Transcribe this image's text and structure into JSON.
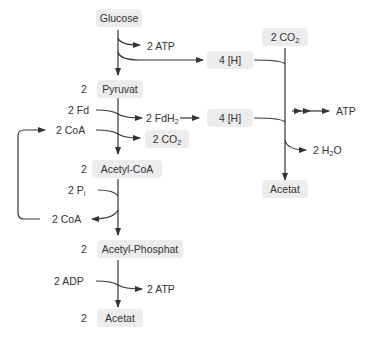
{
  "diagram": {
    "nodes": {
      "glucose": "Glucose",
      "pyruvat": "Pyruvat",
      "pyruvat_coef": "2",
      "acetyl_coa": "Acetyl-CoA",
      "acetyl_coa_coef": "2",
      "acetyl_phosphat": "Acetyl-Phosphat",
      "acetyl_phosphat_coef": "2",
      "acetat_left": "Acetat",
      "acetat_left_coef": "2",
      "h_top": "4  [H]",
      "h_mid": "4  [H]",
      "co2_top_coef": "2",
      "co2_top": "CO",
      "co2_top_sub": "2",
      "co2_mid_coef": "2",
      "co2_mid": "CO",
      "co2_mid_sub": "2",
      "acetat_right": "Acetat"
    },
    "labels": {
      "atp_1": "2  ATP",
      "fd": "2  Fd",
      "fdh2_coef": "2  FdH",
      "fdh2_sub": "2",
      "coa_in": "2  CoA",
      "pi_coef": "2  P",
      "pi_sub": "i",
      "coa_out": "2  CoA",
      "adp": "2  ADP",
      "atp_2": "2  ATP",
      "atp_right": "ATP",
      "h2o_coef": "2  H",
      "h2o_sub": "2",
      "h2o_tail": "O"
    },
    "colors": {
      "box_fill": "#ececec",
      "line": "#333333",
      "text": "#333333"
    }
  }
}
